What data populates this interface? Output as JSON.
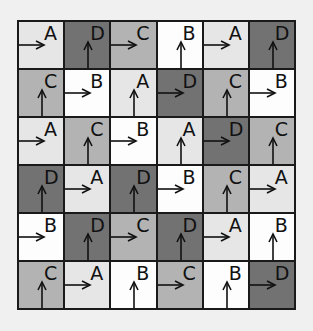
{
  "diagram": {
    "rows": 6,
    "cols": 6,
    "shade_colors": {
      "white": "#fdfdfd",
      "light": "#e6e6e6",
      "mid": "#b3b3b3",
      "dark": "#727272"
    },
    "legend_mapping": {
      "A": "light",
      "B": "white",
      "C": "mid",
      "D": "dark"
    },
    "cells": [
      [
        {
          "letter": "A",
          "shade": "light",
          "arrow": "right"
        },
        {
          "letter": "D",
          "shade": "dark",
          "arrow": "up"
        },
        {
          "letter": "C",
          "shade": "mid",
          "arrow": "right"
        },
        {
          "letter": "B",
          "shade": "white",
          "arrow": "up"
        },
        {
          "letter": "A",
          "shade": "light",
          "arrow": "right"
        },
        {
          "letter": "D",
          "shade": "dark",
          "arrow": "up"
        }
      ],
      [
        {
          "letter": "C",
          "shade": "mid",
          "arrow": "up"
        },
        {
          "letter": "B",
          "shade": "white",
          "arrow": "right"
        },
        {
          "letter": "A",
          "shade": "light",
          "arrow": "up"
        },
        {
          "letter": "D",
          "shade": "dark",
          "arrow": "right"
        },
        {
          "letter": "C",
          "shade": "mid",
          "arrow": "up"
        },
        {
          "letter": "B",
          "shade": "white",
          "arrow": "right"
        }
      ],
      [
        {
          "letter": "A",
          "shade": "light",
          "arrow": "right"
        },
        {
          "letter": "C",
          "shade": "mid",
          "arrow": "up"
        },
        {
          "letter": "B",
          "shade": "white",
          "arrow": "right"
        },
        {
          "letter": "A",
          "shade": "light",
          "arrow": "up"
        },
        {
          "letter": "D",
          "shade": "dark",
          "arrow": "right"
        },
        {
          "letter": "C",
          "shade": "mid",
          "arrow": "up"
        }
      ],
      [
        {
          "letter": "D",
          "shade": "dark",
          "arrow": "up"
        },
        {
          "letter": "A",
          "shade": "light",
          "arrow": "right"
        },
        {
          "letter": "D",
          "shade": "dark",
          "arrow": "up"
        },
        {
          "letter": "B",
          "shade": "white",
          "arrow": "right"
        },
        {
          "letter": "C",
          "shade": "mid",
          "arrow": "up"
        },
        {
          "letter": "A",
          "shade": "light",
          "arrow": "right"
        }
      ],
      [
        {
          "letter": "B",
          "shade": "white",
          "arrow": "right"
        },
        {
          "letter": "D",
          "shade": "dark",
          "arrow": "up"
        },
        {
          "letter": "C",
          "shade": "mid",
          "arrow": "right"
        },
        {
          "letter": "D",
          "shade": "dark",
          "arrow": "up"
        },
        {
          "letter": "A",
          "shade": "light",
          "arrow": "right"
        },
        {
          "letter": "B",
          "shade": "white",
          "arrow": "up"
        }
      ],
      [
        {
          "letter": "C",
          "shade": "mid",
          "arrow": "up"
        },
        {
          "letter": "A",
          "shade": "light",
          "arrow": "right"
        },
        {
          "letter": "B",
          "shade": "white",
          "arrow": "up"
        },
        {
          "letter": "C",
          "shade": "mid",
          "arrow": "right"
        },
        {
          "letter": "B",
          "shade": "white",
          "arrow": "up"
        },
        {
          "letter": "D",
          "shade": "dark",
          "arrow": "right"
        }
      ]
    ]
  }
}
